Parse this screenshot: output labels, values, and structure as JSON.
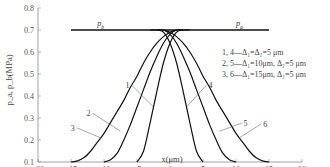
{
  "chart_data": {
    "type": "line",
    "title": "",
    "xlabel": "x(μm)",
    "ylabel": "p_a, p_b(MPa)",
    "xlim": [
      -20,
      20
    ],
    "ylim": [
      0.1,
      0.8
    ],
    "xticks": [
      "-20",
      "-15",
      "-10",
      "-5",
      "0",
      "5",
      "10",
      "15",
      "20"
    ],
    "xtick_values": [
      -20,
      -15,
      -10,
      -5,
      0,
      5,
      10,
      15,
      20
    ],
    "yticks": [
      "0.1",
      "0.2",
      "0.3",
      "0.4",
      "0.5",
      "0.6",
      "0.7",
      "0.8"
    ],
    "ytick_values": [
      0.1,
      0.2,
      0.3,
      0.4,
      0.5,
      0.6,
      0.7,
      0.8
    ],
    "grid": false,
    "reference_lines": [
      {
        "name": "p_b",
        "label": "p_b",
        "y": 0.7,
        "x": [
          -15,
          0
        ]
      },
      {
        "name": "p_a",
        "label": "p_a",
        "y": 0.7,
        "x": [
          0,
          15
        ]
      }
    ],
    "series": [
      {
        "name": "1",
        "label": "1",
        "x": [
          -5,
          -4,
          -3,
          -2,
          -1,
          0,
          1,
          2,
          3
        ],
        "y": [
          0.1,
          0.15,
          0.28,
          0.42,
          0.55,
          0.64,
          0.69,
          0.7,
          0.7
        ]
      },
      {
        "name": "2",
        "label": "2",
        "x": [
          -10,
          -9,
          -8,
          -7,
          -6,
          -5,
          -4,
          -3,
          -2,
          -1,
          0,
          1,
          2
        ],
        "y": [
          0.1,
          0.11,
          0.14,
          0.2,
          0.27,
          0.35,
          0.43,
          0.51,
          0.58,
          0.64,
          0.68,
          0.7,
          0.7
        ]
      },
      {
        "name": "3",
        "label": "3",
        "x": [
          -15,
          -14,
          -13,
          -12,
          -11,
          -10,
          -9,
          -8,
          -7,
          -6,
          -5,
          -4,
          -3,
          -2,
          -1,
          0,
          1
        ],
        "y": [
          0.1,
          0.105,
          0.12,
          0.15,
          0.19,
          0.23,
          0.28,
          0.33,
          0.38,
          0.44,
          0.49,
          0.55,
          0.6,
          0.64,
          0.67,
          0.69,
          0.7
        ]
      },
      {
        "name": "4",
        "label": "4",
        "x": [
          -3,
          -2,
          -1,
          0,
          1,
          2,
          3,
          4,
          5
        ],
        "y": [
          0.7,
          0.7,
          0.69,
          0.64,
          0.55,
          0.42,
          0.28,
          0.15,
          0.1
        ]
      },
      {
        "name": "5",
        "label": "5",
        "x": [
          -2,
          -1,
          0,
          1,
          2,
          3,
          4,
          5,
          6,
          7,
          8,
          9,
          10
        ],
        "y": [
          0.7,
          0.7,
          0.68,
          0.64,
          0.58,
          0.51,
          0.43,
          0.35,
          0.27,
          0.2,
          0.14,
          0.11,
          0.1
        ]
      },
      {
        "name": "6",
        "label": "6",
        "x": [
          -1,
          0,
          1,
          2,
          3,
          4,
          5,
          6,
          7,
          8,
          9,
          10,
          11,
          12,
          13,
          14,
          15
        ],
        "y": [
          0.7,
          0.69,
          0.67,
          0.64,
          0.6,
          0.55,
          0.49,
          0.44,
          0.38,
          0.33,
          0.28,
          0.23,
          0.19,
          0.15,
          0.12,
          0.105,
          0.1
        ]
      }
    ],
    "curve_label_anchors": [
      {
        "label": "1",
        "x": -2.5,
        "y": 0.35
      },
      {
        "label": "2",
        "x": -7.5,
        "y": 0.24
      },
      {
        "label": "3",
        "x": -10.5,
        "y": 0.21
      },
      {
        "label": "4",
        "x": 2.5,
        "y": 0.35
      },
      {
        "label": "5",
        "x": 7.5,
        "y": 0.24
      },
      {
        "label": "6",
        "x": 10.5,
        "y": 0.21
      }
    ],
    "legend": {
      "placement": "right",
      "entries": [
        "1, 4—Δ₁=Δ₂=5 μm",
        "2, 5—Δ₁=10μm, Δ₂=5 μm",
        "3, 6—Δ₁=15μm, Δ₂=5 μm"
      ]
    }
  }
}
